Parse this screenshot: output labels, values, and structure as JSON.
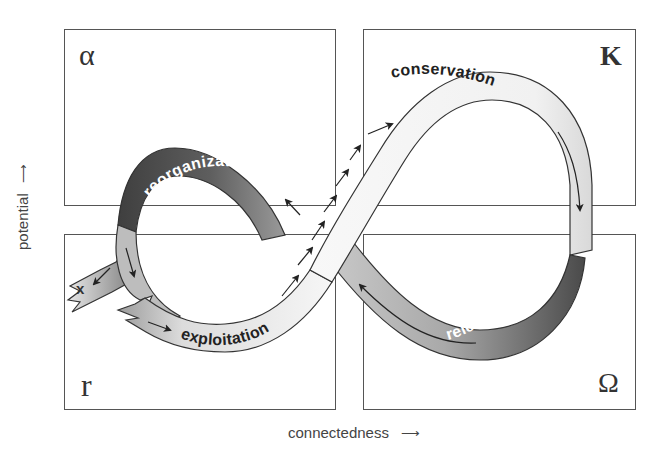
{
  "quadrants": [
    {
      "id": "alpha",
      "symbol": "α",
      "position": "top-left"
    },
    {
      "id": "K",
      "symbol": "K",
      "position": "top-right"
    },
    {
      "id": "r",
      "symbol": "r",
      "position": "bottom-left"
    },
    {
      "id": "omega",
      "symbol": "Ω",
      "position": "bottom-right"
    }
  ],
  "axes": {
    "y_label": "potential",
    "y_arrow": "⟶",
    "x_label": "connectedness",
    "x_arrow": "⟶"
  },
  "phases": [
    {
      "name": "reorganization",
      "shade": "dark",
      "color": "#555555"
    },
    {
      "name": "conservation",
      "shade": "light",
      "color": "#f2f2f2"
    },
    {
      "name": "release",
      "shade": "dark",
      "color": "#5a5a5a"
    },
    {
      "name": "exploitation",
      "shade": "light",
      "color": "#f4f4f4"
    }
  ],
  "exit_marker": "x",
  "colors": {
    "border": "#555555",
    "text_dark": "#222222",
    "ribbon_dark": "#4d4d4d",
    "ribbon_mid": "#a8a8a8",
    "ribbon_light": "#f3f3f3"
  }
}
